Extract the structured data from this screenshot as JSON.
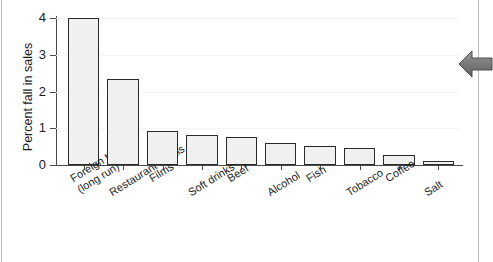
{
  "chart_data": {
    "type": "bar",
    "title": "",
    "subtitle": "",
    "xlabel": "",
    "ylabel": "Percent fall in sales",
    "ylim": [
      0,
      4
    ],
    "yticks": [
      0,
      1,
      2,
      3,
      4
    ],
    "ytick_labels": [
      "0",
      "1",
      "2",
      "3",
      "4"
    ],
    "grid": true,
    "legend": false,
    "legend_position": "none",
    "categories": [
      "Foreign travel (long run)",
      "Restaurant meals",
      "Films",
      "Soft drinks",
      "Beef",
      "Alcohol",
      "Fish",
      "Tobacco",
      "Coffee",
      "Salt"
    ],
    "category_lines": [
      [
        "Foreign travel",
        "(long run)"
      ],
      [
        "Restaurant meals"
      ],
      [
        "Films"
      ],
      [
        "Soft drinks"
      ],
      [
        "Beef"
      ],
      [
        "Alcohol"
      ],
      [
        "Fish"
      ],
      [
        "Tobacco"
      ],
      [
        "Coffee"
      ],
      [
        "Salt"
      ]
    ],
    "values": [
      4.0,
      2.35,
      0.93,
      0.82,
      0.75,
      0.6,
      0.52,
      0.45,
      0.28,
      0.1
    ],
    "bar_face_color": "#f0f0f0",
    "bar_edge_color": "#2b2b2b",
    "axis_color": "#4a4a4a",
    "grid_color": "#f2f4f6"
  },
  "annotation": {
    "pointer_icon": "left-arrow-icon",
    "pointer_color": "#808080"
  }
}
